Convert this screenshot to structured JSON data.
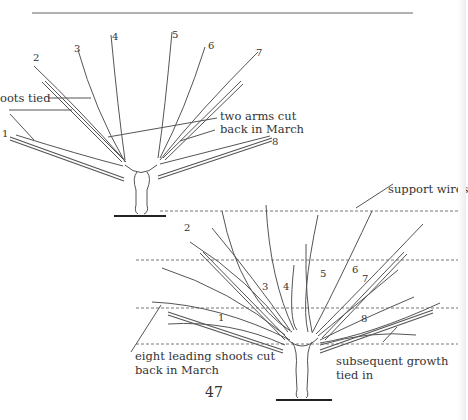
{
  "page": {
    "page_number": "47"
  },
  "figure_top": {
    "branch_numbers": [
      "1",
      "2",
      "3",
      "4",
      "5",
      "6",
      "7",
      "8"
    ],
    "labels": {
      "shoots_tied": "oots tied",
      "two_arms_line1": "two arms cut",
      "two_arms_line2": "back in March"
    }
  },
  "figure_bottom": {
    "branch_numbers": [
      "1",
      "2",
      "3",
      "4",
      "5",
      "6",
      "7",
      "8"
    ],
    "labels": {
      "support_wires": "support wires",
      "eight_leading_line1": "eight leading shoots cut",
      "eight_leading_line2": "back in March",
      "subsequent_line1": "subsequent growth",
      "subsequent_line2": "tied in"
    }
  }
}
